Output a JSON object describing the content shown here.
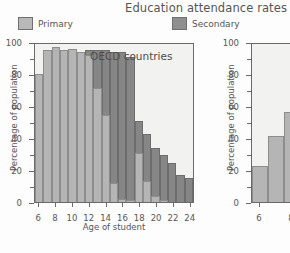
{
  "title": "Education attendance rates",
  "legend": {
    "items": [
      {
        "label": "Primary",
        "color": "#b5b5b5",
        "icon": "legend-swatch-icon"
      },
      {
        "label": "Secondary",
        "color": "#868686",
        "icon": "legend-swatch-icon"
      }
    ]
  },
  "chart_data": [
    {
      "type": "bar",
      "title": "Education attendance rates",
      "annotation": "OECD countries",
      "xlabel": "Age of student",
      "ylabel": "Percentage of population",
      "stacked": true,
      "grid": false,
      "legend_position": "top",
      "xlim": [
        5,
        25
      ],
      "ylim": [
        0,
        100
      ],
      "yticks": [
        0,
        20,
        40,
        60,
        80,
        100
      ],
      "yticklabels": [
        "0",
        "20",
        "40",
        "60",
        "80",
        "100"
      ],
      "yminorticks": [
        10,
        30,
        50,
        70,
        90
      ],
      "xticks": [
        6,
        8,
        10,
        12,
        14,
        16,
        18,
        20,
        22,
        24
      ],
      "xticklabels": [
        "6",
        "8",
        "10",
        "12",
        "14",
        "16",
        "18",
        "20",
        "22",
        "24"
      ],
      "categories": [
        6,
        7,
        8,
        9,
        10,
        11,
        12,
        13,
        14,
        15,
        16,
        17,
        18,
        19,
        20,
        21,
        22,
        23,
        24
      ],
      "series": [
        {
          "name": "Primary",
          "values": [
            81,
            96,
            98,
            96,
            97,
            95,
            93,
            72,
            55,
            12,
            2,
            1,
            31,
            13,
            4,
            1,
            0,
            0,
            0
          ]
        },
        {
          "name": "Secondary",
          "values": [
            0,
            0,
            0,
            0,
            0,
            0,
            3,
            24,
            41,
            83,
            93,
            91,
            20,
            30,
            30,
            29,
            25,
            17,
            15
          ]
        }
      ],
      "totals": [
        81,
        96,
        98,
        96,
        97,
        95,
        96,
        96,
        96,
        95,
        95,
        92,
        51,
        43,
        34,
        30,
        25,
        17,
        15
      ]
    },
    {
      "type": "bar",
      "xlabel": "",
      "ylabel": "Percentage of population",
      "stacked": false,
      "grid": false,
      "clipped": true,
      "ylim": [
        0,
        100
      ],
      "yticks": [
        0,
        20,
        40,
        60,
        80,
        100
      ],
      "yticklabels": [
        "0",
        "20",
        "40",
        "60",
        "80",
        "100"
      ],
      "yminorticks": [
        10,
        30,
        50,
        70,
        90
      ],
      "xticks": [
        6,
        8
      ],
      "xticklabels": [
        "6",
        "8"
      ],
      "categories": [
        6,
        7,
        8,
        9
      ],
      "series": [
        {
          "name": "Primary",
          "values": [
            23,
            42,
            57,
            67
          ]
        }
      ]
    }
  ]
}
